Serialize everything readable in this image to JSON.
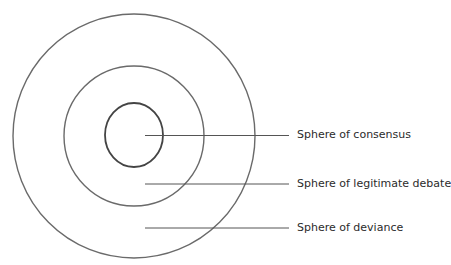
{
  "diagram": {
    "type": "concentric-spheres",
    "colors": {
      "circle_outer": "#6a6a6a",
      "circle_middle": "#6a6a6a",
      "circle_inner": "#444444",
      "leader_line": "#555555",
      "text": "#2b2b2b"
    },
    "labels": [
      {
        "text": "Sphere of consensus"
      },
      {
        "text": "Sphere of legitimate debate"
      },
      {
        "text": "Sphere of deviance"
      }
    ]
  }
}
